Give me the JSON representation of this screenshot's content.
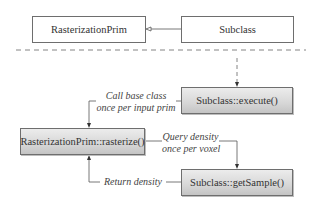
{
  "top": {
    "base_class": "RasterizationPrim",
    "subclass": "Subclass"
  },
  "flow": {
    "execute": "Subclass::execute()",
    "rasterize": "RasterizationPrim::rasterize()",
    "get_sample": "Subclass::getSample()"
  },
  "labels": {
    "call_base_line1": "Call base class",
    "call_base_line2": "once per input prim",
    "query_line1": "Query density",
    "query_line2": "once per voxel",
    "return_density": "Return density"
  }
}
